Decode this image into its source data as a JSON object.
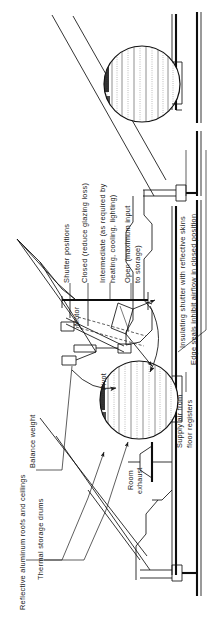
{
  "figure": {
    "type": "technical-section-diagram",
    "orientation": "rotated-90-ccw",
    "background_color": "#ffffff",
    "line_color": "#111111",
    "text_color": "#1a1a1a"
  },
  "labels": {
    "shutter_positions": "Shutter positions",
    "closed": "Closed (reduce glazing loss)",
    "intermediate_line1": "Intermediate (as required by",
    "intermediate_line2": "heating, cooling, lighting)",
    "open_line1": "Open (maximum input",
    "open_line2": "to storage)",
    "motor": "Motor",
    "pivot": "Pivot",
    "balance_weight": "Balance weight",
    "reflective_roofs": "Reflective aluminum roofs and ceilings",
    "thermal_storage_drums": "Thermal storage drums",
    "room_exhaust_line1": "Room",
    "room_exhaust_line2": "exhaust",
    "insulating_shutter": "Insulating shutter with reflective skins",
    "edge_seals": "Edge seals inhibit airflow in closed position",
    "supply_air_line1": "Supply air from",
    "supply_air_line2": "floor registers"
  },
  "icons": {
    "pivot_arrow": "curved-rotation-arrow-icon",
    "exhaust_arrow": "flared-duct-icon",
    "leader_arrow": "arrowhead-icon"
  }
}
